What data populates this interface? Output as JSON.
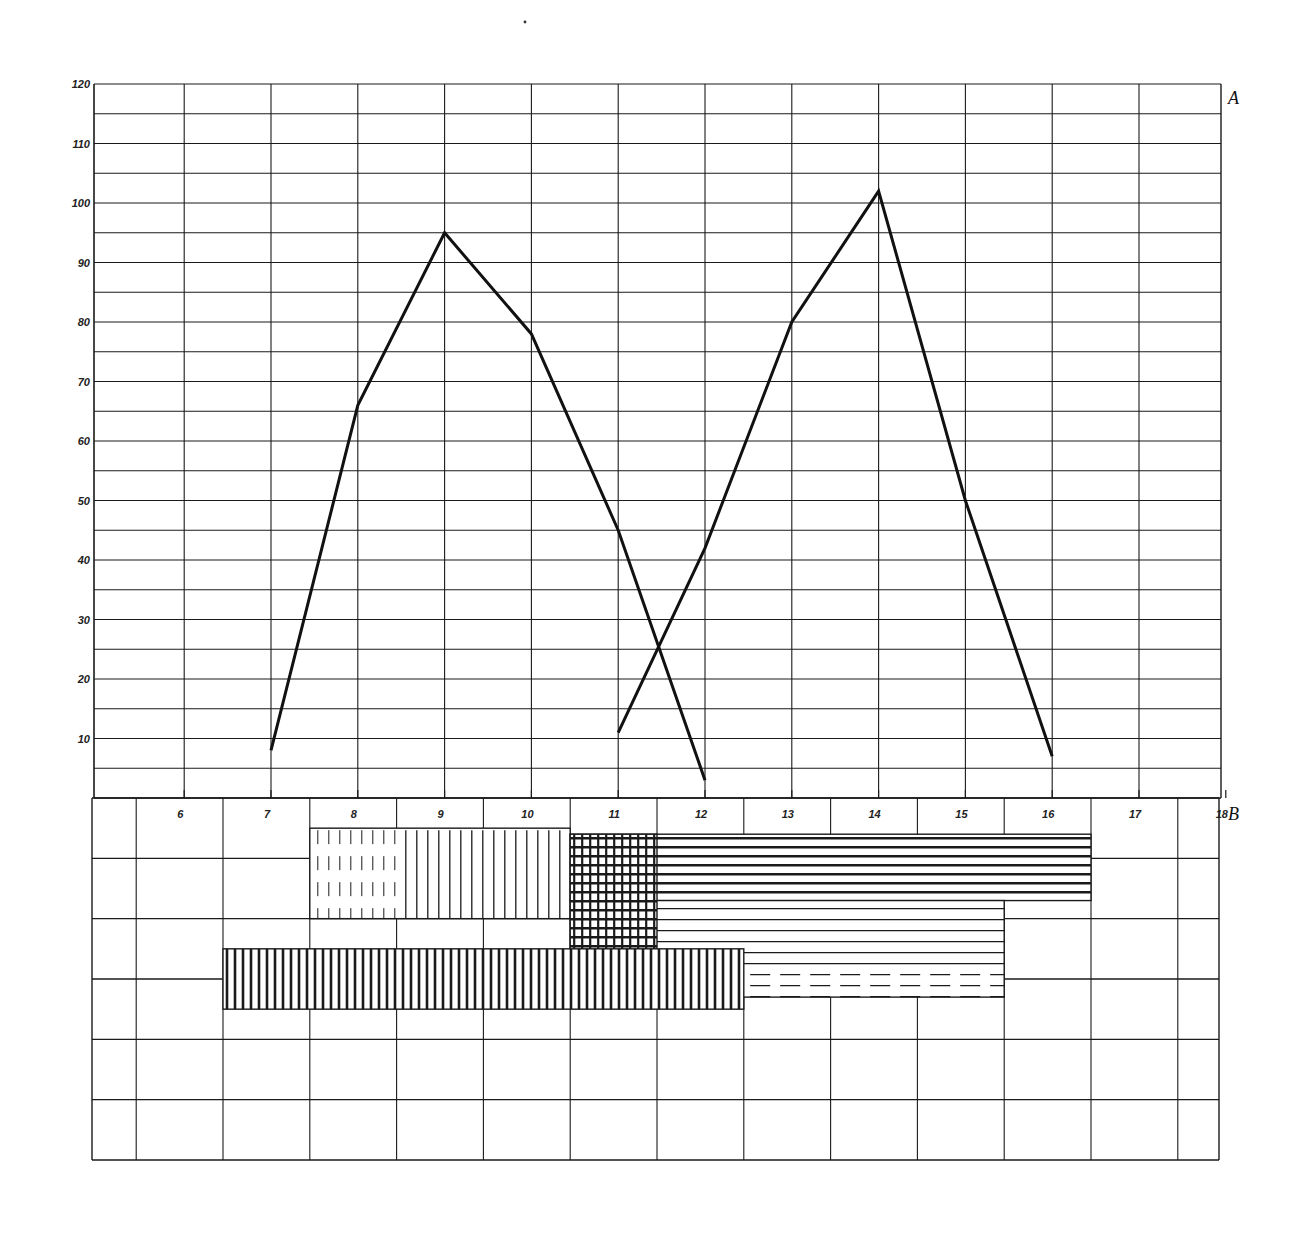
{
  "chart_data": [
    {
      "type": "line",
      "title": "",
      "axis_label": "A",
      "xlabel": "",
      "ylabel": "",
      "x": [
        6,
        7,
        8,
        9,
        10,
        11,
        12,
        13,
        14,
        15,
        16,
        17,
        18
      ],
      "y_ticks": [
        10,
        20,
        30,
        40,
        50,
        60,
        70,
        80,
        90,
        100,
        110,
        120
      ],
      "ylim": [
        0,
        120
      ],
      "xlim": [
        5,
        18
      ],
      "grid": true,
      "series": [
        {
          "name": "curve-1",
          "x": [
            7,
            8,
            9,
            10,
            11,
            12
          ],
          "values": [
            8,
            66,
            95,
            78,
            45,
            3
          ]
        },
        {
          "name": "curve-2",
          "x": [
            11,
            12,
            13,
            14,
            15,
            16
          ],
          "values": [
            11,
            42,
            80,
            102,
            50,
            7
          ]
        }
      ]
    },
    {
      "type": "bar",
      "subtype": "gantt-hatched",
      "axis_label": "B",
      "x_ticks": [
        6,
        7,
        8,
        9,
        10,
        11,
        12,
        13,
        14,
        15,
        16,
        17,
        18
      ],
      "rows": 6,
      "bars": [
        {
          "name": "upper-light-vertical-hatch",
          "x_start": 7.5,
          "x_end": 10.5,
          "row_top": 0.5,
          "row_bottom": 2.0,
          "pattern": "dashed-vertical-then-vertical"
        },
        {
          "name": "upper-heavy-horizontal-hatch",
          "x_start": 10.5,
          "x_end": 16.5,
          "row_top": 0.6,
          "row_bottom": 1.7,
          "pattern": "dense-horizontal"
        },
        {
          "name": "middle-horizontal-hatch",
          "x_start": 10.5,
          "x_end": 15.5,
          "row_top": 1.7,
          "row_bottom": 3.3,
          "pattern": "horizontal-with-dashes"
        },
        {
          "name": "cross-hatch-block",
          "x_start": 10.5,
          "x_end": 11.5,
          "row_top": 0.6,
          "row_bottom": 3.3,
          "pattern": "cross"
        },
        {
          "name": "lower-heavy-vertical-hatch",
          "x_start": 6.5,
          "x_end": 12.5,
          "row_top": 2.5,
          "row_bottom": 3.5,
          "pattern": "dense-vertical"
        }
      ]
    }
  ],
  "labels": {
    "axis_a": "A",
    "axis_b": "B"
  },
  "colors": {
    "ink": "#1a1a1a",
    "paper": "#ffffff"
  }
}
